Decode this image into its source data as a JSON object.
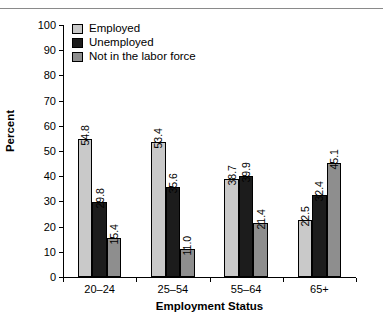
{
  "chart_data": {
    "type": "bar",
    "title": "",
    "xlabel": "Employment Status",
    "ylabel": "Percent",
    "categories": [
      "20–24",
      "25–54",
      "55–64",
      "65+"
    ],
    "series": [
      {
        "name": "Employed",
        "color": "#c9c9c9",
        "values": [
          54.8,
          53.4,
          38.7,
          22.5
        ]
      },
      {
        "name": "Unemployed",
        "color": "#1c1c1c",
        "values": [
          29.8,
          35.6,
          39.9,
          32.4
        ]
      },
      {
        "name": "Not in the labor force",
        "color": "#8e8e8e",
        "values": [
          15.4,
          11.0,
          21.4,
          45.1
        ]
      }
    ],
    "value_labels": [
      [
        "54.8",
        "29.8",
        "15.4"
      ],
      [
        "53.4",
        "35.6",
        "11.0"
      ],
      [
        "38.7",
        "39.9",
        "21.4"
      ],
      [
        "22.5",
        "32.4",
        "45.1"
      ]
    ],
    "ylim": [
      0,
      100
    ],
    "yticks": [
      "0",
      "10",
      "20",
      "30",
      "40",
      "50",
      "60",
      "70",
      "80",
      "90",
      "100"
    ],
    "grid": false,
    "legend_position": "top-left",
    "legend_entries": [
      "Employed",
      "Unemployed",
      "Not in the labor force"
    ]
  }
}
